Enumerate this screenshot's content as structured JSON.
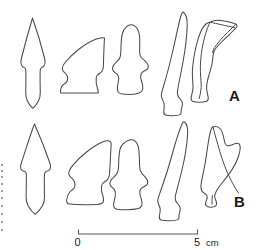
{
  "figure": {
    "background_color": "#ffffff",
    "outline_color": "#4a4a4a",
    "label_color": "#1a1a1a",
    "width_px": 257,
    "height_px": 250
  },
  "rows": [
    {
      "id": "row-a",
      "label": "A",
      "label_x": 229,
      "label_y": 101,
      "artifacts": [
        {
          "id": "a1",
          "name": "barbed-and-tanged-arrowhead",
          "description": "Barbed and tanged arrowhead with pointed tip, lateral barbs and tapering tang"
        },
        {
          "id": "a2",
          "name": "backed-triangular-blade",
          "description": "Obliquely backed triangular blade with notched basal margin"
        },
        {
          "id": "a3",
          "name": "shouldered-stemmed-point",
          "description": "Shouldered point with narrow stem and expanded base"
        },
        {
          "id": "a4",
          "name": "curved-backed-blade",
          "description": "Long curved backed blade, crescentic profile"
        },
        {
          "id": "a5",
          "name": "ridged-flake-blade",
          "description": "Flake with dorsal ridge scar and truncated base"
        }
      ]
    },
    {
      "id": "row-b",
      "label": "B",
      "label_x": 234,
      "label_y": 207,
      "artifacts": [
        {
          "id": "b1",
          "name": "barbed-and-tanged-arrowhead",
          "description": "Barbed and tanged arrowhead, broad blade with squared tang"
        },
        {
          "id": "b2",
          "name": "backed-triangular-blade",
          "description": "Obliquely backed triangular blade with notched basal margin"
        },
        {
          "id": "b3",
          "name": "shouldered-stemmed-point",
          "description": "Shouldered point with tapering stem"
        },
        {
          "id": "b4",
          "name": "curved-backed-blade",
          "description": "Long curved backed blade with constricted base"
        },
        {
          "id": "b5",
          "name": "notched-flake-tool",
          "description": "Broad notched flake tool with spur and interior ridge"
        }
      ]
    }
  ],
  "scale_bar": {
    "name": "scale-bar",
    "start_label": "0",
    "end_label": "5",
    "unit_label": "cm",
    "length_cm": 5,
    "bar_start_x": 78,
    "bar_end_x": 198,
    "bar_y": 234,
    "tick_height": 5
  }
}
